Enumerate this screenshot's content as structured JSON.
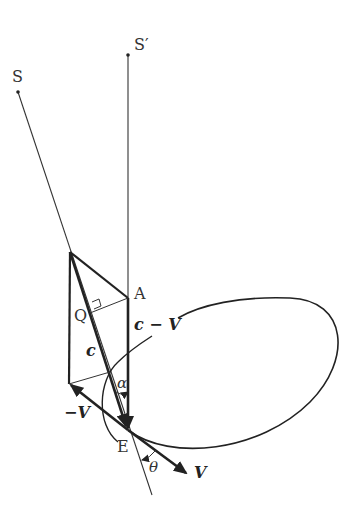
{
  "diagram": {
    "type": "vector-geometry",
    "points": {
      "S": {
        "label": "S"
      },
      "S_prime": {
        "label": "S′"
      },
      "A": {
        "label": "A"
      },
      "Q": {
        "label": "Q"
      },
      "E": {
        "label": "E"
      }
    },
    "vectors": {
      "c": {
        "label": "c"
      },
      "c_minus_V": {
        "label": "c − V"
      },
      "neg_V": {
        "label": "−V"
      },
      "V": {
        "label": "V"
      }
    },
    "angles": {
      "alpha": {
        "label": "α"
      },
      "theta": {
        "label": "θ"
      }
    },
    "colors": {
      "line": "#222222",
      "text": "#333333",
      "background": "#ffffff"
    }
  }
}
